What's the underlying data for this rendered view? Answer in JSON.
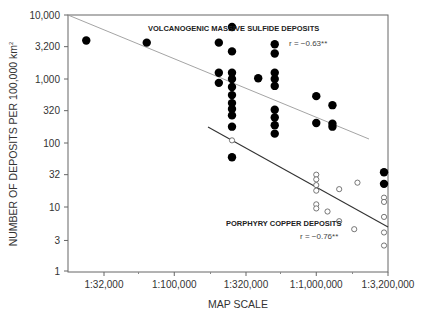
{
  "chart_data": {
    "type": "scatter",
    "title": "",
    "xlabel": "MAP SCALE",
    "ylabel": "NUMBER OF DEPOSITS PER 100,000 km",
    "ylabel_superscript": "2",
    "x_scale": "log",
    "y_scale": "log",
    "x_ticks": [
      {
        "label": "1:32,000",
        "value": 32000
      },
      {
        "label": "1:100,000",
        "value": 100000
      },
      {
        "label": "1:320,000",
        "value": 320000
      },
      {
        "label": "1:1,000,000",
        "value": 1000000
      },
      {
        "label": "1:3,200,000",
        "value": 3200000
      }
    ],
    "y_ticks": [
      {
        "label": "1",
        "value": 1
      },
      {
        "label": "3",
        "value": 3
      },
      {
        "label": "10",
        "value": 10
      },
      {
        "label": "32",
        "value": 32
      },
      {
        "label": "100",
        "value": 100
      },
      {
        "label": "320",
        "value": 320
      },
      {
        "label": "1,000",
        "value": 1000
      },
      {
        "label": "3,200",
        "value": 3200
      },
      {
        "label": "10,000",
        "value": 10000
      }
    ],
    "xlim": [
      18000,
      3200000
    ],
    "ylim": [
      1,
      10000
    ],
    "grid": false,
    "legend": "inline annotations",
    "series": [
      {
        "name": "VOLCANOGENIC MASSIVE SULFIDE DEPOSITS",
        "marker": "filled-circle",
        "r_label": "r = −0.63**",
        "trendline": {
          "x": [
            18000,
            2500000
          ],
          "y": [
            10000,
            145
          ]
        },
        "points": [
          {
            "x": 24000,
            "y": 4000
          },
          {
            "x": 64000,
            "y": 3700
          },
          {
            "x": 206000,
            "y": 3700
          },
          {
            "x": 206000,
            "y": 1250
          },
          {
            "x": 206000,
            "y": 870
          },
          {
            "x": 255000,
            "y": 6500
          },
          {
            "x": 255000,
            "y": 2700
          },
          {
            "x": 255000,
            "y": 1250
          },
          {
            "x": 255000,
            "y": 1000
          },
          {
            "x": 255000,
            "y": 750
          },
          {
            "x": 255000,
            "y": 560
          },
          {
            "x": 255000,
            "y": 420
          },
          {
            "x": 255000,
            "y": 340
          },
          {
            "x": 255000,
            "y": 270
          },
          {
            "x": 255000,
            "y": 180
          },
          {
            "x": 255000,
            "y": 60
          },
          {
            "x": 390000,
            "y": 1030
          },
          {
            "x": 510000,
            "y": 3500
          },
          {
            "x": 510000,
            "y": 2500
          },
          {
            "x": 510000,
            "y": 1250
          },
          {
            "x": 510000,
            "y": 1000
          },
          {
            "x": 510000,
            "y": 780
          },
          {
            "x": 510000,
            "y": 330
          },
          {
            "x": 510000,
            "y": 250
          },
          {
            "x": 510000,
            "y": 190
          },
          {
            "x": 510000,
            "y": 140
          },
          {
            "x": 1000000,
            "y": 540
          },
          {
            "x": 1000000,
            "y": 205
          },
          {
            "x": 1300000,
            "y": 390
          },
          {
            "x": 1300000,
            "y": 200
          },
          {
            "x": 1300000,
            "y": 180
          },
          {
            "x": 3000000,
            "y": 35
          },
          {
            "x": 3000000,
            "y": 23
          }
        ]
      },
      {
        "name": "PORPHYRY COPPER DEPOSITS",
        "marker": "open-circle",
        "r_label": "r = −0.76**",
        "trendline": {
          "x": [
            150000,
            3200000
          ],
          "y": [
            190
          ],
          "y_end": 5
        },
        "points": [
          {
            "x": 255000,
            "y": 110
          },
          {
            "x": 1000000,
            "y": 32
          },
          {
            "x": 1000000,
            "y": 27
          },
          {
            "x": 1000000,
            "y": 22
          },
          {
            "x": 1000000,
            "y": 18
          },
          {
            "x": 1000000,
            "y": 11
          },
          {
            "x": 1000000,
            "y": 9.5
          },
          {
            "x": 1200000,
            "y": 8.5
          },
          {
            "x": 1450000,
            "y": 19
          },
          {
            "x": 1950000,
            "y": 24
          },
          {
            "x": 1450000,
            "y": 6
          },
          {
            "x": 1850000,
            "y": 4.5
          },
          {
            "x": 3000000,
            "y": 14
          },
          {
            "x": 3000000,
            "y": 12
          },
          {
            "x": 3000000,
            "y": 7
          },
          {
            "x": 3000000,
            "y": 4
          },
          {
            "x": 3000000,
            "y": 2.5
          }
        ]
      }
    ]
  },
  "labels": {
    "vms_name": "VOLCANOGENIC MASSIVE SULFIDE DEPOSITS",
    "vms_r": "r = −0.63**",
    "porphyry_name": "PORPHYRY COPPER DEPOSITS",
    "porphyry_r": "r = −0.76**",
    "xlabel": "MAP SCALE",
    "ylabel": "NUMBER OF DEPOSITS PER 100,000 km",
    "ylabel_sup": "2"
  },
  "colors": {
    "axis": "#555555",
    "vms_line": "#9a9a9a",
    "porphyry_line": "#333333",
    "marker_fill": "#000000",
    "open_marker_stroke": "#555555"
  }
}
